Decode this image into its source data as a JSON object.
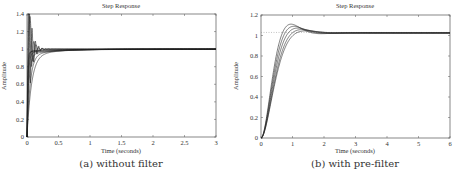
{
  "chart_data": [
    {
      "type": "line",
      "title": "Step Response",
      "xlabel": "Time (seconds)",
      "ylabel": "Amplitude",
      "caption": "(a) without filter",
      "xlim": [
        0,
        3
      ],
      "ylim": [
        0,
        1.4
      ],
      "xticks": [
        0,
        0.5,
        1,
        1.5,
        2,
        2.5,
        3
      ],
      "xtick_labels": [
        "0",
        "0.5",
        "1",
        "1.5",
        "2",
        "2.5",
        "3"
      ],
      "yticks": [
        0,
        0.2,
        0.4,
        0.6,
        0.8,
        1,
        1.2,
        1.4
      ],
      "ytick_labels": [
        "0",
        "0.2",
        "0.4",
        "0.6",
        "0.8",
        "1",
        "1.2",
        "1.4"
      ],
      "grid": false,
      "reference_line": null,
      "series": [
        {
          "name": "response-1",
          "params": {
            "kind": "underdamped",
            "wn": 120,
            "zeta": 0.15,
            "final": 1.0
          }
        },
        {
          "name": "response-2",
          "params": {
            "kind": "underdamped",
            "wn": 90,
            "zeta": 0.25,
            "final": 1.0
          }
        },
        {
          "name": "response-3",
          "params": {
            "kind": "underdamped",
            "wn": 70,
            "zeta": 0.3,
            "final": 1.0
          }
        },
        {
          "name": "response-4",
          "params": {
            "kind": "fastslow",
            "tau": 0.015,
            "dip": 0.02,
            "tau2": 0.6,
            "final": 1.0
          }
        },
        {
          "name": "response-5",
          "params": {
            "kind": "fastslow",
            "tau": 0.02,
            "dip": 0.04,
            "tau2": 0.5,
            "final": 1.0
          }
        },
        {
          "name": "response-6",
          "params": {
            "kind": "fastslow",
            "tau": 0.03,
            "dip": 0.06,
            "tau2": 0.45,
            "final": 1.0
          }
        },
        {
          "name": "response-7",
          "params": {
            "kind": "fastslow",
            "tau": 0.05,
            "dip": 0.07,
            "tau2": 0.4,
            "final": 1.0
          }
        },
        {
          "name": "response-8",
          "params": {
            "kind": "fastslow",
            "tau": 0.07,
            "dip": 0.08,
            "tau2": 0.4,
            "final": 1.0
          }
        },
        {
          "name": "response-9",
          "params": {
            "kind": "fastslow",
            "tau": 0.01,
            "dip": 0.03,
            "tau2": 0.7,
            "final": 1.0
          }
        }
      ]
    },
    {
      "type": "line",
      "title": "Step Response",
      "xlabel": "Time (seconds)",
      "ylabel": "Amplitude",
      "caption": "(b) with pre-filter",
      "xlim": [
        0,
        6
      ],
      "ylim": [
        0,
        1.2
      ],
      "xticks": [
        0,
        1,
        2,
        3,
        4,
        5,
        6
      ],
      "xtick_labels": [
        "0",
        "1",
        "2",
        "3",
        "4",
        "5",
        "6"
      ],
      "yticks": [
        0,
        0.2,
        0.4,
        0.6,
        0.8,
        1,
        1.2
      ],
      "ytick_labels": [
        "0",
        "0.2",
        "0.4",
        "0.6",
        "0.8",
        "1",
        "1.2"
      ],
      "grid": false,
      "reference_line": {
        "y": 1.03,
        "xmax": 1.0,
        "style": "dotted"
      },
      "series": [
        {
          "name": "response-1",
          "params": {
            "kind": "underdamped",
            "wn": 4.2,
            "zeta": 0.62,
            "final": 1.025
          }
        },
        {
          "name": "response-2",
          "params": {
            "kind": "underdamped",
            "wn": 4.0,
            "zeta": 0.66,
            "final": 1.025
          }
        },
        {
          "name": "response-3",
          "params": {
            "kind": "underdamped",
            "wn": 3.8,
            "zeta": 0.7,
            "final": 1.025
          }
        },
        {
          "name": "response-4",
          "params": {
            "kind": "underdamped",
            "wn": 3.6,
            "zeta": 0.74,
            "final": 1.025
          }
        },
        {
          "name": "response-5",
          "params": {
            "kind": "underdamped",
            "wn": 3.5,
            "zeta": 0.78,
            "final": 1.025
          }
        }
      ]
    }
  ]
}
